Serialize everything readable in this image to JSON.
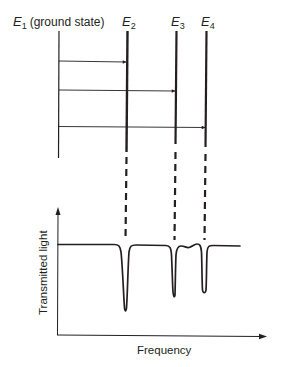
{
  "diagram": {
    "levels": [
      {
        "id": "E1",
        "symbol": "E",
        "subscript": "1",
        "note": "(ground state)",
        "x": 59,
        "top": 31,
        "bottom": 158,
        "stroke": 1.2
      },
      {
        "id": "E2",
        "symbol": "E",
        "subscript": "2",
        "note": "",
        "x": 127,
        "top": 31,
        "bottom": 152,
        "stroke": 2.4
      },
      {
        "id": "E3",
        "symbol": "E",
        "subscript": "3",
        "note": "",
        "x": 176,
        "top": 31,
        "bottom": 144,
        "stroke": 2.2
      },
      {
        "id": "E4",
        "symbol": "E",
        "subscript": "4",
        "note": "",
        "x": 206,
        "top": 31,
        "bottom": 147,
        "stroke": 2.2
      }
    ],
    "transitions": [
      {
        "from": "E1",
        "to": "E2",
        "y": 61
      },
      {
        "from": "E1",
        "to": "E3",
        "y": 90
      },
      {
        "from": "E1",
        "to": "E4",
        "y": 127
      }
    ],
    "dash_connectors": [
      {
        "level": "E2",
        "x": 127,
        "y1": 155,
        "y2": 240
      },
      {
        "level": "E3",
        "x": 175,
        "y1": 150,
        "y2": 240
      },
      {
        "level": "E4",
        "x": 205,
        "y1": 152,
        "y2": 240
      }
    ],
    "spectrum": {
      "y_axis_label": "Transmitted light",
      "x_axis_label": "Frequency",
      "baseline_y": 245,
      "absorption_dips": [
        {
          "level": "E2",
          "x": 125,
          "depth_y": 311
        },
        {
          "level": "E3",
          "x": 174,
          "depth_y": 296
        },
        {
          "level": "E4",
          "x": 204,
          "depth_y": 292
        }
      ]
    }
  },
  "labels": {
    "e1_symbol": "E",
    "e1_sub": "1",
    "e1_note": "(ground state)",
    "e2_symbol": "E",
    "e2_sub": "2",
    "e3_symbol": "E",
    "e3_sub": "3",
    "e4_symbol": "E",
    "e4_sub": "4",
    "y_axis": "Transmitted light",
    "x_axis": "Frequency"
  },
  "colors": {
    "ink": "#231f20",
    "background": "#ffffff"
  }
}
